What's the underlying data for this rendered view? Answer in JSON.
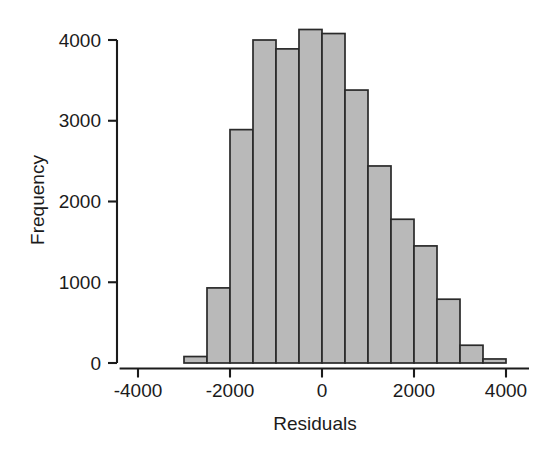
{
  "chart_data": {
    "type": "bar",
    "subtype": "histogram",
    "title": "",
    "subtitle": "",
    "xlabel": "Residuals",
    "ylabel": "Frequency",
    "xlim": [
      -4400,
      4500
    ],
    "ylim": [
      0,
      4250
    ],
    "grid": false,
    "legend": null,
    "bin_width": 500,
    "x_ticks": [
      -4000,
      -2000,
      0,
      2000,
      4000
    ],
    "x_tick_labels": [
      "-4000",
      "-2000",
      "0",
      "2000",
      "4000"
    ],
    "y_ticks": [
      0,
      1000,
      2000,
      3000,
      4000
    ],
    "y_tick_labels": [
      "0",
      "1000",
      "2000",
      "3000",
      "4000"
    ],
    "bin_edges": [
      -3000,
      -2500,
      -2000,
      -1500,
      -1000,
      -500,
      0,
      500,
      1000,
      1500,
      2000,
      2500,
      3000,
      3500,
      4000
    ],
    "bin_centers": [
      -2750,
      -2250,
      -1750,
      -1250,
      -750,
      -250,
      250,
      750,
      1250,
      1750,
      2250,
      2750,
      3250,
      3750
    ],
    "values": [
      80,
      930,
      2890,
      4000,
      3890,
      4130,
      4080,
      3380,
      2440,
      1780,
      1450,
      790,
      220,
      50
    ],
    "bar_fill_color": "#b9b9b9",
    "bar_border_color": "#2a2a2a",
    "axis_color": "#1b1b1b",
    "background_color": "#ffffff"
  },
  "axes": {
    "x_title": "Residuals",
    "y_title": "Frequency"
  }
}
